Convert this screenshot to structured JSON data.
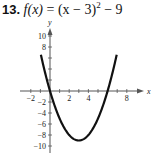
{
  "problem": {
    "number": "13.",
    "function_prefix": "f(x)",
    "function_body": " = (x − 3)",
    "exponent": "2",
    "function_suffix": " − 9"
  },
  "chart_data": {
    "type": "line",
    "xlabel": "x",
    "ylabel": "y",
    "xlim": [
      -3,
      9
    ],
    "ylim": [
      -11,
      11
    ],
    "x_ticks": [
      -2,
      2,
      4,
      8
    ],
    "y_ticks": [
      10,
      8,
      -2,
      -4,
      -6,
      -8,
      -10
    ],
    "x_tick_labels": [
      "−2",
      "2",
      "4",
      "8"
    ],
    "y_tick_labels": [
      "10",
      "8",
      "−2",
      "−4",
      "−6",
      "−8",
      "−10"
    ],
    "grid": false,
    "series": [
      {
        "name": "f(x) = (x − 3)² − 9",
        "x": [
          -0.6,
          0,
          1,
          2,
          3,
          4,
          5,
          6,
          6.6
        ],
        "y": [
          3.96,
          0,
          -5,
          -8,
          -9,
          -8,
          -5,
          0,
          3.96
        ]
      }
    ],
    "vertex": [
      3,
      -9
    ],
    "roots": [
      0,
      6
    ]
  },
  "colors": {
    "curve": "#111111",
    "axis": "#555555"
  }
}
